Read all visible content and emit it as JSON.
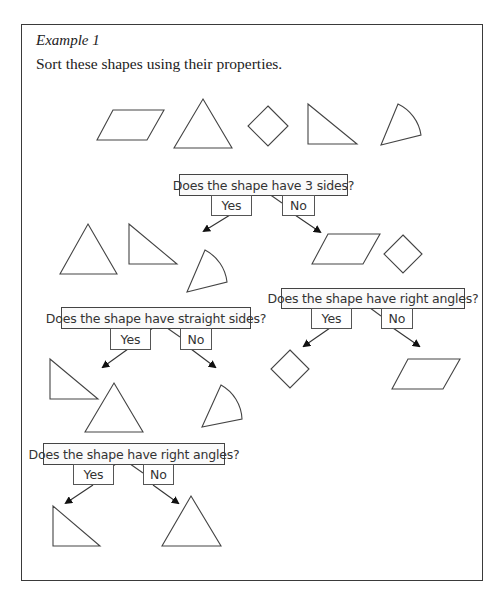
{
  "header": {
    "title": "Example 1",
    "instruction": "Sort these shapes using their properties."
  },
  "colors": {
    "stroke": "#444444",
    "frame": "#3a3a3a",
    "box_bg": "#fafafa",
    "text": "#333333"
  },
  "initial_shapes": [
    {
      "icon": "parallelogram-icon",
      "label": "parallelogram"
    },
    {
      "icon": "equilateral-triangle-icon",
      "label": "equilateral triangle"
    },
    {
      "icon": "square-diamond-icon",
      "label": "square (rotated)"
    },
    {
      "icon": "right-triangle-icon",
      "label": "right-angled triangle"
    },
    {
      "icon": "sector-icon",
      "label": "sector"
    }
  ],
  "decisions": [
    {
      "id": "q1",
      "question": "Does the shape have 3 sides?",
      "yes_label": "Yes",
      "no_label": "No",
      "yes_shapes": [
        "equilateral triangle",
        "right-angled triangle",
        "sector"
      ],
      "no_shapes": [
        "parallelogram",
        "square (rotated)"
      ]
    },
    {
      "id": "q2",
      "question": "Does the shape have right angles?",
      "yes_label": "Yes",
      "no_label": "No",
      "yes_shapes": [
        "square (rotated)"
      ],
      "no_shapes": [
        "parallelogram"
      ]
    },
    {
      "id": "q3",
      "question": "Does the shape have straight sides?",
      "yes_label": "Yes",
      "no_label": "No",
      "yes_shapes": [
        "right-angled triangle",
        "equilateral triangle"
      ],
      "no_shapes": [
        "sector"
      ]
    },
    {
      "id": "q4",
      "question": "Does the shape have right angles?",
      "yes_label": "Yes",
      "no_label": "No",
      "yes_shapes": [
        "right-angled triangle"
      ],
      "no_shapes": [
        "equilateral triangle"
      ]
    }
  ]
}
